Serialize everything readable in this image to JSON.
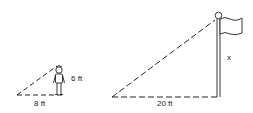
{
  "diagram": {
    "type": "similar-triangles-shadow",
    "small_triangle": {
      "height_label": "6 ft",
      "base_label": "8 ft"
    },
    "large_triangle": {
      "height_label": "x",
      "base_label": "20 ft"
    },
    "colors": {
      "stroke": "#222222",
      "background": "#ffffff"
    }
  }
}
